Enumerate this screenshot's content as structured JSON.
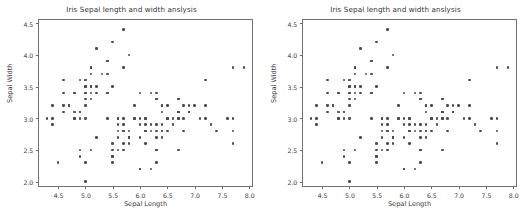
{
  "figure": {
    "background_color": "#ffffff",
    "panel_count": 2
  },
  "panels": [
    {
      "id": "left",
      "title": "Iris Sepal length and width anslysis"
    },
    {
      "id": "right",
      "title": "Iris Sepal length and width anslysis"
    }
  ],
  "chart_data": {
    "type": "scatter",
    "title": "Iris Sepal length and width anslysis",
    "xlabel": "Sepal Length",
    "ylabel": "Sepal Width",
    "xlim": [
      4.15,
      8.05
    ],
    "ylim": [
      1.93,
      4.55
    ],
    "xticks": [
      4.5,
      5.0,
      5.5,
      6.0,
      6.5,
      7.0,
      7.5,
      8.0
    ],
    "yticks": [
      2.0,
      2.5,
      3.0,
      3.5,
      4.0,
      4.5
    ],
    "xticklabels": [
      "4.5",
      "5.0",
      "5.5",
      "6.0",
      "6.5",
      "7.0",
      "7.5",
      "8.0"
    ],
    "yticklabels": [
      "2.0",
      "2.5",
      "3.0",
      "3.5",
      "4.0",
      "4.5"
    ],
    "grid": false,
    "legend": null,
    "marker_color": "#4b4b55",
    "marker_size": 2.6,
    "n_points": 150,
    "series": [
      {
        "name": "Iris samples",
        "x": [
          5.1,
          4.9,
          4.7,
          4.6,
          5.0,
          5.4,
          4.6,
          5.0,
          4.4,
          4.9,
          5.4,
          4.8,
          4.8,
          4.3,
          5.8,
          5.7,
          5.4,
          5.1,
          5.7,
          5.1,
          5.4,
          5.1,
          4.6,
          5.1,
          4.8,
          5.0,
          5.0,
          5.2,
          5.2,
          4.7,
          4.8,
          5.4,
          5.2,
          5.5,
          4.9,
          5.0,
          5.5,
          4.9,
          4.4,
          5.1,
          5.0,
          4.5,
          4.4,
          5.0,
          5.1,
          4.8,
          5.1,
          4.6,
          5.3,
          5.0,
          7.0,
          6.4,
          6.9,
          5.5,
          6.5,
          5.7,
          6.3,
          4.9,
          6.6,
          5.2,
          5.0,
          5.9,
          6.0,
          6.1,
          5.6,
          6.7,
          5.6,
          5.8,
          6.2,
          5.6,
          5.9,
          6.1,
          6.3,
          6.1,
          6.4,
          6.6,
          6.8,
          6.7,
          6.0,
          5.7,
          5.5,
          5.5,
          5.8,
          6.0,
          5.4,
          6.0,
          6.7,
          6.3,
          5.6,
          5.5,
          5.5,
          6.1,
          5.8,
          5.0,
          5.6,
          5.7,
          5.7,
          6.2,
          5.1,
          5.7,
          6.3,
          5.8,
          7.1,
          6.3,
          6.5,
          7.6,
          4.9,
          7.3,
          6.7,
          7.2,
          6.5,
          6.4,
          6.8,
          5.7,
          5.8,
          6.4,
          6.5,
          7.7,
          7.7,
          6.0,
          6.9,
          5.6,
          7.7,
          6.3,
          6.7,
          7.2,
          6.2,
          6.1,
          6.4,
          7.2,
          7.4,
          7.9,
          6.4,
          6.3,
          6.1,
          7.7,
          6.3,
          6.4,
          6.0,
          6.9,
          6.7,
          6.9,
          5.8,
          6.8,
          6.7,
          6.7,
          6.3,
          6.5,
          6.2,
          5.9
        ],
        "y": [
          3.5,
          3.0,
          3.2,
          3.1,
          3.6,
          3.9,
          3.4,
          3.4,
          2.9,
          3.1,
          3.7,
          3.4,
          3.0,
          3.0,
          4.0,
          4.4,
          3.9,
          3.5,
          3.8,
          3.8,
          3.4,
          3.7,
          3.6,
          3.3,
          3.4,
          3.0,
          3.4,
          3.5,
          3.4,
          3.2,
          3.1,
          3.4,
          4.1,
          4.2,
          3.1,
          3.2,
          3.5,
          3.6,
          3.0,
          3.4,
          3.5,
          2.3,
          3.2,
          3.5,
          3.8,
          3.0,
          3.8,
          3.2,
          3.7,
          3.3,
          3.2,
          3.2,
          3.1,
          2.3,
          2.8,
          2.8,
          3.3,
          2.4,
          2.9,
          2.7,
          2.0,
          3.0,
          2.2,
          2.9,
          2.9,
          3.1,
          3.0,
          2.7,
          2.2,
          2.5,
          3.2,
          2.8,
          2.5,
          2.8,
          2.9,
          3.0,
          2.8,
          3.0,
          2.9,
          2.6,
          2.4,
          2.4,
          2.7,
          2.7,
          3.0,
          3.4,
          3.1,
          2.3,
          3.0,
          2.5,
          2.6,
          3.0,
          2.6,
          2.3,
          2.7,
          3.0,
          2.9,
          2.9,
          2.5,
          2.8,
          3.3,
          2.7,
          3.0,
          2.9,
          3.0,
          3.0,
          2.5,
          2.9,
          2.5,
          3.6,
          3.2,
          2.7,
          3.0,
          2.5,
          2.8,
          3.2,
          3.0,
          3.8,
          2.6,
          2.2,
          3.2,
          2.8,
          2.8,
          2.7,
          3.3,
          3.2,
          2.8,
          3.0,
          2.8,
          3.0,
          2.8,
          3.8,
          2.8,
          2.8,
          2.6,
          3.0,
          3.4,
          3.1,
          3.0,
          3.1,
          3.1,
          3.1,
          2.7,
          3.2,
          3.3,
          3.0,
          2.5,
          3.0,
          3.4,
          3.0
        ]
      }
    ]
  }
}
